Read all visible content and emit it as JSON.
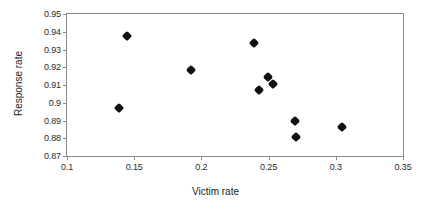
{
  "chart_data": {
    "type": "scatter",
    "title": "",
    "xlabel": "Victim rate",
    "ylabel": "Response rate",
    "xlim": [
      0.1,
      0.35
    ],
    "ylim": [
      0.87,
      0.95
    ],
    "xticks": [
      "0.1",
      "0.15",
      "0.2",
      "0.25",
      "0.3",
      "0.35"
    ],
    "xtick_values": [
      0.1,
      0.15,
      0.2,
      0.25,
      0.3,
      0.35
    ],
    "yticks": [
      "0.95",
      "0.94",
      "0.93",
      "0.92",
      "0.91",
      "0.9",
      "0.89",
      "0.88",
      "0.87"
    ],
    "ytick_values": [
      0.95,
      0.94,
      0.93,
      0.92,
      0.91,
      0.9,
      0.89,
      0.88,
      0.87
    ],
    "grid": false,
    "legend": null,
    "marker": "filled-diamond",
    "marker_color": "#121212",
    "axis_color": "#8a8a8a",
    "background": "#ffffff",
    "points": [
      {
        "x": 0.1445,
        "y": 0.9375
      },
      {
        "x": 0.1385,
        "y": 0.8969
      },
      {
        "x": 0.1925,
        "y": 0.9183
      },
      {
        "x": 0.2395,
        "y": 0.9339
      },
      {
        "x": 0.2432,
        "y": 0.9072
      },
      {
        "x": 0.2497,
        "y": 0.9144
      },
      {
        "x": 0.2533,
        "y": 0.9106
      },
      {
        "x": 0.2697,
        "y": 0.89
      },
      {
        "x": 0.2704,
        "y": 0.8805
      },
      {
        "x": 0.3044,
        "y": 0.8861
      }
    ]
  }
}
